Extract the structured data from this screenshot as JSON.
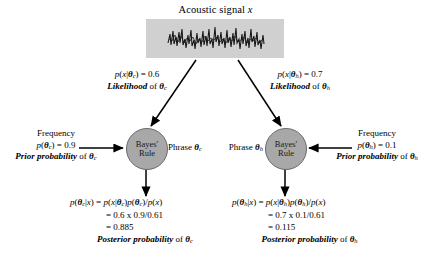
{
  "diagram": {
    "signal": {
      "caption_text": "Acoustic signal",
      "caption_var": "x",
      "box_color": "#d0d0d0"
    },
    "branches": [
      {
        "id": "c",
        "likelihood_formula": "p(x|θc) = 0.6",
        "likelihood_caption_bold": "Likelihood",
        "likelihood_caption_rest": "of θc",
        "prior_header": "Frequency",
        "prior_formula": "p(θc) = 0.9",
        "prior_caption_bold": "Prior probability",
        "prior_caption_rest": "of θc",
        "node_label_line1": "Bayes'",
        "node_label_line2": "Rule",
        "phrase_label": "Phrase θc",
        "posterior_line1": "p(θc|x) = p(x|θc)p(θc)/p(x)",
        "posterior_line2": "= 0.6 x 0.9/0.61",
        "posterior_line3": "= 0.885",
        "posterior_caption_bold": "Posterior probability",
        "posterior_caption_rest": "of θc"
      },
      {
        "id": "h",
        "likelihood_formula": "p(x|θh) = 0.7",
        "likelihood_caption_bold": "Likelihood",
        "likelihood_caption_rest": "of θh",
        "prior_header": "Frequency",
        "prior_formula": "p(θh) = 0.1",
        "prior_caption_bold": "Prior probability",
        "prior_caption_rest": "of θh",
        "node_label_line1": "Bayes'",
        "node_label_line2": "Rule",
        "phrase_label": "Phrase θh",
        "posterior_line1": "p(θh|x) = p(x|θh)p(θh)/p(x)",
        "posterior_line2": "= 0.7 x 0.1/0.61",
        "posterior_line3": "= 0.115",
        "posterior_caption_bold": "Posterior probability",
        "posterior_caption_rest": "of θh"
      }
    ],
    "colors": {
      "node_fill": "#a8a8a8",
      "node_stroke": "#6a6a6a",
      "signal_fill": "#d0d0d0",
      "arrow": "#000000",
      "text": "#000000"
    }
  }
}
